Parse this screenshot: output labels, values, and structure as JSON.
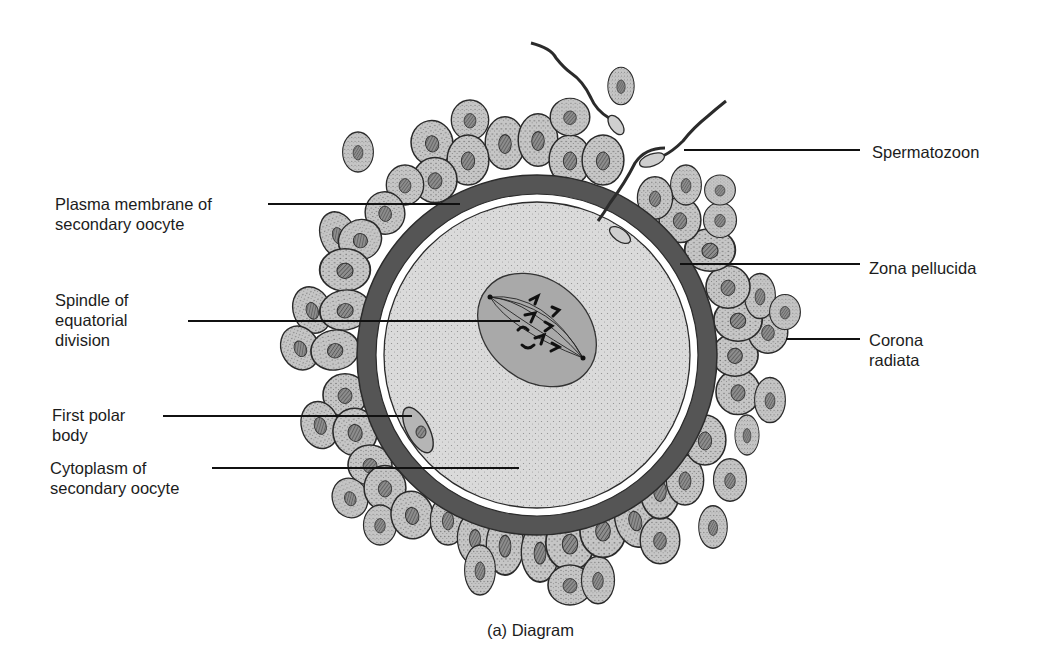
{
  "figure": {
    "caption": "(a) Diagram",
    "colors": {
      "background": "#ffffff",
      "zona_pellucida": "#555555",
      "cytoplasm": "#d9d9d9",
      "spindle_region": "#a9a9a9",
      "corona_cell": "#c4c4c4",
      "cell_outline": "#2a2a2a",
      "nucleus": "#7a7a7a",
      "leader_line": "#111111",
      "text": "#1c1c1c"
    }
  },
  "labels": {
    "left": [
      {
        "id": "plasma-membrane",
        "lines": [
          "Plasma membrane of",
          "secondary oocyte"
        ]
      },
      {
        "id": "spindle",
        "lines": [
          "Spindle of",
          "equatorial",
          "division"
        ]
      },
      {
        "id": "first-polar-body",
        "lines": [
          "First polar",
          "body"
        ]
      },
      {
        "id": "cytoplasm",
        "lines": [
          "Cytoplasm of",
          "secondary oocyte"
        ]
      }
    ],
    "right": [
      {
        "id": "spermatozoon",
        "lines": [
          "Spermatozoon"
        ]
      },
      {
        "id": "zona-pellucida",
        "lines": [
          "Zona pellucida"
        ]
      },
      {
        "id": "corona-radiata",
        "lines": [
          "Corona",
          "radiata"
        ]
      }
    ]
  }
}
